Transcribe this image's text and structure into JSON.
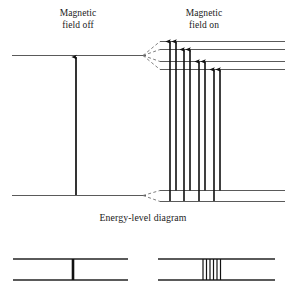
{
  "figure": {
    "caption": "Energy-level diagram",
    "labels": {
      "field_off": "Magnetic\nfield off",
      "field_on": "Magnetic\nfield on"
    },
    "colors": {
      "level_line": "#5a5a5a",
      "transition_arrow": "#101010",
      "dashed_guide": "#707070",
      "spectral_line": "#111111",
      "background": "#ffffff",
      "text": "#1a1a1a"
    },
    "unsplit": {
      "upper_level": {
        "label": "upper energy level",
        "x1": 12,
        "x2": 146,
        "y": 55.5
      },
      "lower_level": {
        "label": "lower energy level",
        "x1": 12,
        "x2": 146,
        "y": 195.5
      },
      "transition": {
        "label": "single transition",
        "x": 76,
        "y_top": 57,
        "y_bottom": 195
      }
    },
    "split": {
      "upper_levels": [
        {
          "index": 1,
          "y": 41.5,
          "x1": 160,
          "x2": 285
        },
        {
          "index": 2,
          "y": 49.5,
          "x1": 160,
          "x2": 285
        },
        {
          "index": 3,
          "y": 61.5,
          "x1": 160,
          "x2": 285
        },
        {
          "index": 4,
          "y": 69.5,
          "x1": 160,
          "x2": 285
        }
      ],
      "lower_levels": [
        {
          "index": 1,
          "y": 190.5,
          "x1": 160,
          "x2": 285
        },
        {
          "index": 2,
          "y": 201.5,
          "x1": 160,
          "x2": 285
        }
      ],
      "upper_fan_origin": {
        "x": 143,
        "y": 55.5
      },
      "lower_fan_origin": {
        "x": 143,
        "y": 195.5
      },
      "transitions": [
        {
          "index": 1,
          "x": 170,
          "y_top": 41.5,
          "y_bottom": 201.0
        },
        {
          "index": 2,
          "x": 176,
          "y_top": 41.5,
          "y_bottom": 190.5
        },
        {
          "index": 3,
          "x": 184,
          "y_top": 49.5,
          "y_bottom": 201.0
        },
        {
          "index": 4,
          "x": 190,
          "y_top": 49.5,
          "y_bottom": 190.5
        },
        {
          "index": 5,
          "x": 199,
          "y_top": 61.5,
          "y_bottom": 201.0
        },
        {
          "index": 6,
          "x": 205,
          "y_top": 61.5,
          "y_bottom": 190.5
        },
        {
          "index": 7,
          "x": 214,
          "y_top": 69.5,
          "y_bottom": 201.0
        },
        {
          "index": 8,
          "x": 220,
          "y_top": 69.5,
          "y_bottom": 190.5
        }
      ]
    },
    "spectra": {
      "unsplit": {
        "name": "spectrum with field off",
        "frame": {
          "x1": 13,
          "x2": 128,
          "y_top": 259,
          "y_bottom": 280
        },
        "lines": [
          {
            "x": 73,
            "width": 2.6
          }
        ],
        "line_count": 1
      },
      "split": {
        "name": "spectrum with field on",
        "frame": {
          "x1": 158,
          "x2": 275,
          "y_top": 259,
          "y_bottom": 280
        },
        "lines": [
          {
            "x": 203,
            "width": 1.2
          },
          {
            "x": 206.5,
            "width": 1.2
          },
          {
            "x": 210,
            "width": 1.2
          },
          {
            "x": 213.5,
            "width": 1.2
          },
          {
            "x": 217,
            "width": 1.2
          },
          {
            "x": 220.5,
            "width": 1.2
          }
        ],
        "line_count": 6
      }
    }
  }
}
